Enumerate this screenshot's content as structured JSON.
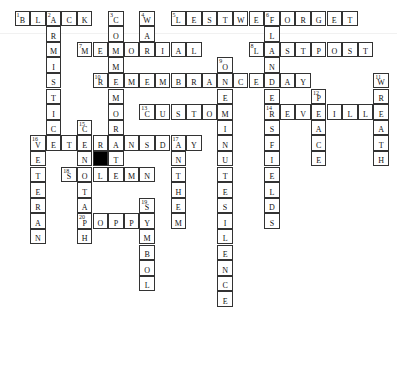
{
  "puzzle": {
    "type": "crossword",
    "rows": 19,
    "cols": 24,
    "black_cells": [
      [
        9,
        5
      ]
    ],
    "entries": [
      {
        "number": "1",
        "direction": "across",
        "answer": "BLACK",
        "row": 0,
        "col": 0
      },
      {
        "number": "2",
        "direction": "down",
        "answer": "ARMISTICE",
        "row": 0,
        "col": 2
      },
      {
        "number": "3",
        "direction": "down",
        "answer": "COMMEMORATE",
        "row": 0,
        "col": 6
      },
      {
        "number": "4",
        "direction": "down",
        "answer": "WAR",
        "row": 0,
        "col": 8
      },
      {
        "number": "5",
        "direction": "across",
        "answer": "LESTWEFORGET",
        "row": 0,
        "col": 10
      },
      {
        "number": "6",
        "direction": "down",
        "answer": "FLANDERSFIELDS",
        "row": 0,
        "col": 16
      },
      {
        "number": "7",
        "direction": "across",
        "answer": "MEMORIAL",
        "row": 2,
        "col": 4
      },
      {
        "number": "8",
        "direction": "across",
        "answer": "LASTPOST",
        "row": 2,
        "col": 15
      },
      {
        "number": "9",
        "direction": "down",
        "answer": "ONEMINUTESILENCE",
        "row": 3,
        "col": 13
      },
      {
        "number": "10",
        "direction": "across",
        "answer": "REMEMBRANCEDAY",
        "row": 4,
        "col": 5
      },
      {
        "number": "11",
        "direction": "down",
        "answer": "WREATH",
        "row": 4,
        "col": 23
      },
      {
        "number": "12",
        "direction": "down",
        "answer": "PEACE",
        "row": 5,
        "col": 19
      },
      {
        "number": "13",
        "direction": "across",
        "answer": "CUSTOM",
        "row": 6,
        "col": 8
      },
      {
        "number": "14",
        "direction": "across",
        "answer": "REVEILLE",
        "row": 6,
        "col": 16
      },
      {
        "number": "15",
        "direction": "down",
        "answer": "CENOTAPH",
        "row": 7,
        "col": 4
      },
      {
        "number": "16",
        "direction": "across",
        "answer": "VETERANSDAY",
        "row": 8,
        "col": 1
      },
      {
        "number": "16",
        "direction": "down",
        "answer": "VETERAN",
        "row": 8,
        "col": 1
      },
      {
        "number": "17",
        "direction": "down",
        "answer": "ANTHEM",
        "row": 8,
        "col": 10
      },
      {
        "number": "18",
        "direction": "across",
        "answer": "SOLEMN",
        "row": 10,
        "col": 3
      },
      {
        "number": "19",
        "direction": "down",
        "answer": "SYMBOL",
        "row": 12,
        "col": 8
      },
      {
        "number": "20",
        "direction": "across",
        "answer": "POPPY",
        "row": 13,
        "col": 4
      }
    ]
  }
}
